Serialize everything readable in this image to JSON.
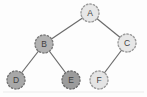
{
  "diagram": {
    "type": "binary-tree",
    "background": "#fdfdfd",
    "edge_color": "#6b6b6b",
    "edge_width": 1.2,
    "label_color": "#3f3f3f",
    "nodes": [
      {
        "id": "A",
        "label": "A",
        "x": 90,
        "y": 13,
        "r": 9,
        "fill": "#e7e7e7",
        "stroke": "#9b9b9b"
      },
      {
        "id": "B",
        "label": "B",
        "x": 44,
        "y": 44,
        "r": 9,
        "fill": "#b2b2b2",
        "stroke": "#7a7a7a"
      },
      {
        "id": "C",
        "label": "C",
        "x": 127,
        "y": 43,
        "r": 9,
        "fill": "#e7e7e7",
        "stroke": "#9b9b9b"
      },
      {
        "id": "D",
        "label": "D",
        "x": 16,
        "y": 80,
        "r": 9,
        "fill": "#a8a8a8",
        "stroke": "#757575"
      },
      {
        "id": "E",
        "label": "E",
        "x": 71,
        "y": 80,
        "r": 9,
        "fill": "#9c9c9c",
        "stroke": "#6e6e6e"
      },
      {
        "id": "F",
        "label": "F",
        "x": 99,
        "y": 80,
        "r": 9,
        "fill": "#e4e4e4",
        "stroke": "#9b9b9b"
      }
    ],
    "edges": [
      {
        "from": "A",
        "to": "B"
      },
      {
        "from": "A",
        "to": "C"
      },
      {
        "from": "B",
        "to": "D"
      },
      {
        "from": "B",
        "to": "E"
      },
      {
        "from": "C",
        "to": "F"
      }
    ]
  }
}
